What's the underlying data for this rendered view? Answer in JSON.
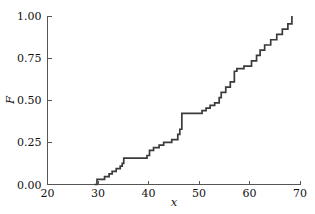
{
  "chart_data": {
    "type": "line",
    "subtype": "empirical-cdf-step",
    "title": "",
    "subtitle": "",
    "xlabel": "x",
    "ylabel": "F",
    "xlim": [
      20,
      70
    ],
    "ylim": [
      0.0,
      1.0
    ],
    "xticks": [
      20,
      30,
      40,
      50,
      60,
      70
    ],
    "xtick_labels": [
      "20",
      "30",
      "40",
      "50",
      "60",
      "70"
    ],
    "yticks": [
      0.0,
      0.25,
      0.5,
      0.75,
      1.0
    ],
    "ytick_labels": [
      "0.00",
      "0.25",
      "0.50",
      "0.75",
      "1.00"
    ],
    "grid": false,
    "legend": null,
    "legend_position": "none",
    "line_color": "#3a3a3a",
    "axis_color": "#555555",
    "background_color": "#ffffff",
    "n_observations": 32,
    "step_style": "post",
    "annotations": [],
    "x": [
      29.3,
      29.8,
      31.3,
      32.2,
      32.8,
      33.6,
      34.4,
      34.8,
      35.1,
      39.7,
      40.2,
      41.0,
      42.1,
      43.0,
      44.6,
      45.8,
      46.2,
      50.6,
      51.4,
      52.2,
      53.1,
      54.0,
      54.4,
      55.3,
      56.2,
      57.0,
      57.5,
      58.9,
      60.4,
      61.4,
      62.1,
      63.0,
      64.2,
      65.4,
      66.5,
      67.6,
      68.4
    ],
    "values": [
      0.0,
      0.031,
      0.047,
      0.063,
      0.078,
      0.094,
      0.109,
      0.125,
      0.156,
      0.172,
      0.203,
      0.219,
      0.234,
      0.25,
      0.266,
      0.297,
      0.328,
      0.422,
      0.438,
      0.453,
      0.469,
      0.484,
      0.516,
      0.547,
      0.578,
      0.609,
      0.672,
      0.688,
      0.703,
      0.734,
      0.766,
      0.797,
      0.828,
      0.859,
      0.891,
      0.922,
      0.953
    ],
    "final_value": 1.0,
    "series": [
      {
        "name": "empirical CDF",
        "points": [
          [
            29.3,
            0.0
          ],
          [
            29.8,
            0.031
          ],
          [
            31.3,
            0.047
          ],
          [
            32.2,
            0.063
          ],
          [
            32.8,
            0.078
          ],
          [
            33.6,
            0.094
          ],
          [
            34.4,
            0.109
          ],
          [
            34.8,
            0.125
          ],
          [
            35.1,
            0.156
          ],
          [
            39.7,
            0.172
          ],
          [
            40.2,
            0.203
          ],
          [
            41.0,
            0.219
          ],
          [
            42.1,
            0.234
          ],
          [
            43.0,
            0.25
          ],
          [
            44.6,
            0.266
          ],
          [
            45.8,
            0.297
          ],
          [
            46.2,
            0.328
          ],
          [
            46.6,
            0.422
          ],
          [
            50.6,
            0.438
          ],
          [
            51.4,
            0.453
          ],
          [
            52.2,
            0.469
          ],
          [
            53.1,
            0.484
          ],
          [
            54.0,
            0.516
          ],
          [
            54.4,
            0.547
          ],
          [
            55.3,
            0.578
          ],
          [
            56.2,
            0.609
          ],
          [
            57.0,
            0.672
          ],
          [
            57.5,
            0.688
          ],
          [
            58.9,
            0.703
          ],
          [
            60.4,
            0.734
          ],
          [
            61.4,
            0.766
          ],
          [
            62.1,
            0.797
          ],
          [
            63.0,
            0.828
          ],
          [
            64.2,
            0.859
          ],
          [
            65.4,
            0.891
          ],
          [
            66.5,
            0.922
          ],
          [
            67.6,
            0.953
          ],
          [
            68.4,
            1.0
          ]
        ]
      }
    ]
  }
}
